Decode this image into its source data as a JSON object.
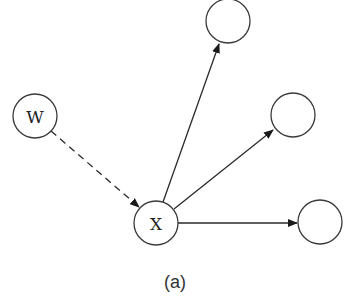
{
  "diagram": {
    "caption": "(a)",
    "nodes": [
      {
        "id": "W",
        "label": "W",
        "cx": 35,
        "cy": 116,
        "r": 22
      },
      {
        "id": "X",
        "label": "X",
        "cx": 156,
        "cy": 223,
        "r": 22
      },
      {
        "id": "top",
        "label": "",
        "cx": 228,
        "cy": 21,
        "r": 22
      },
      {
        "id": "mid",
        "label": "",
        "cx": 293,
        "cy": 115,
        "r": 22
      },
      {
        "id": "bottom",
        "label": "",
        "cx": 320,
        "cy": 222,
        "r": 22
      }
    ],
    "edges": [
      {
        "from": "W",
        "to": "X",
        "style": "dashed",
        "directed": true
      },
      {
        "from": "X",
        "to": "top",
        "style": "solid",
        "directed": true
      },
      {
        "from": "X",
        "to": "mid",
        "style": "solid",
        "directed": true
      },
      {
        "from": "X",
        "to": "bottom",
        "style": "solid",
        "directed": true
      }
    ],
    "colors": {
      "stroke": "#3a3a3a",
      "background": "#ffffff",
      "text": "#222222"
    }
  }
}
